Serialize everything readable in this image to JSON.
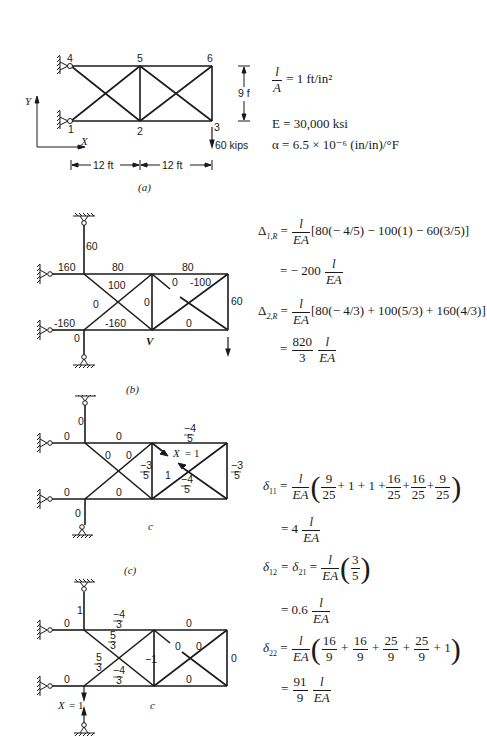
{
  "figure_a": {
    "caption": "(a)",
    "nodes": [
      "1",
      "2",
      "3",
      "4",
      "5",
      "6"
    ],
    "height_label": "9 ft",
    "span_labels": [
      "12 ft",
      "12 ft"
    ],
    "load_label": "60 kips",
    "axis_x": "X",
    "axis_y": "Y",
    "props": {
      "l_over_A": "= 1 ft/in²",
      "E": "E = 30,000 ksi",
      "alpha": "α = 6.5 × 10⁻⁶ (in/in)/°F"
    }
  },
  "figure_b": {
    "caption": "(b)",
    "member_forces": {
      "top_support": "60",
      "upper_left_support": "160",
      "lower_left_support": "-160",
      "bottom_support": "0",
      "top_chord_1": "80",
      "top_chord_2": "80",
      "diag_1_down": "100",
      "diag_1_up": "0",
      "bottom_chord_1": "-160",
      "vertical_mid": "0",
      "diag_2_down": "0",
      "diag_2_up": "-100",
      "bottom_chord_2": "0",
      "vertical_right": "60",
      "load": "60"
    },
    "label_VR": "V",
    "label_VR_sub": "R",
    "equations": {
      "d1R_lhs": "Δ",
      "d1R_sub": "1,R",
      "d1R_bracket": "[80(− 4/5) − 100(1) − 60(3/5)]",
      "d1R_result_coef": "= − 200",
      "d2R_lhs": "Δ",
      "d2R_sub": "2,R",
      "d2R_bracket": "[80(− 4/3) + 100(5/3) + 160(4/3)]",
      "d2R_result_num": "820",
      "d2R_result_den": "3"
    }
  },
  "figure_c": {
    "caption": "(c)",
    "c1": {
      "label": "c",
      "label_sub": "1",
      "forces": {
        "top_support": "0",
        "upper_left_support": "0",
        "lower_left_support": "0",
        "bottom_support": "0",
        "top_chord_1": "0",
        "top_chord_2_num": "−4",
        "top_chord_2_den": "5",
        "diag_1_down": "0",
        "diag_1_up": "0",
        "bottom_chord_1": "0",
        "vertical_mid_num": "−3",
        "vertical_mid_den": "5",
        "diag_2_up": "1",
        "bottom_chord_2_num": "−4",
        "bottom_chord_2_den": "5",
        "vertical_right_num": "−3",
        "vertical_right_den": "5",
        "redundant": "X",
        "redundant_sub": "1",
        "redundant_val": "= 1"
      }
    },
    "c2": {
      "label": "c",
      "label_sub": "2",
      "forces": {
        "top_support": "1",
        "upper_left_support": "0",
        "lower_left_support": "0",
        "top_chord_1_num": "−4",
        "top_chord_1_den": "3",
        "diag_1_down_num": "5",
        "diag_1_down_den": "3",
        "diag_1_up_num": "5",
        "diag_1_up_den": "3",
        "bottom_chord_1_num": "−4",
        "bottom_chord_1_den": "3",
        "vertical_mid": "−1",
        "top_chord_2": "0",
        "diag_2_down": "0",
        "diag_2_up": "0",
        "bottom_chord_2": "0",
        "vertical_right": "0",
        "redundant": "X",
        "redundant_sub": "2",
        "redundant_val": "= 1"
      }
    },
    "equations": {
      "d11_sym": "δ",
      "d11_sub": "11",
      "d11_terms": [
        {
          "num": "9",
          "den": "25"
        },
        {
          "plain": "+ 1 + 1 +"
        },
        {
          "num": "16",
          "den": "25"
        },
        {
          "plain": "+"
        },
        {
          "num": "16",
          "den": "25"
        },
        {
          "plain": "+"
        },
        {
          "num": "9",
          "den": "25"
        }
      ],
      "d11_result_coef": "= 4",
      "d12_lhs": "δ",
      "d12_sub": "12",
      "d21_sym": "= δ",
      "d21_sub": "21",
      "d12_num": "3",
      "d12_den": "5",
      "d12_result_coef": "= 0.6",
      "d22_sym": "δ",
      "d22_sub": "22",
      "d22_result_num": "91",
      "d22_result_den": "9"
    }
  },
  "common": {
    "l": "l",
    "EA": "EA",
    "A": "A",
    "eq": "=",
    "plus": "+",
    "one": "1"
  }
}
